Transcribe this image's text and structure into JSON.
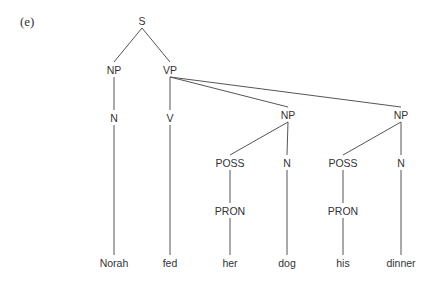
{
  "figure_label": "(e)",
  "nodes": {
    "S": {
      "label": "S",
      "x": 142,
      "y": 25
    },
    "NP1": {
      "label": "NP",
      "x": 114,
      "y": 74
    },
    "VP": {
      "label": "VP",
      "x": 170,
      "y": 74
    },
    "N1": {
      "label": "N",
      "x": 114,
      "y": 122
    },
    "V": {
      "label": "V",
      "x": 170,
      "y": 122
    },
    "NP2": {
      "label": "NP",
      "x": 288,
      "y": 119
    },
    "NP3": {
      "label": "NP",
      "x": 401,
      "y": 119
    },
    "POSS1": {
      "label": "POSS",
      "x": 230,
      "y": 167
    },
    "N2": {
      "label": "N",
      "x": 287,
      "y": 167
    },
    "POSS2": {
      "label": "POSS",
      "x": 343,
      "y": 167
    },
    "N3": {
      "label": "N",
      "x": 401,
      "y": 167
    },
    "PRON1": {
      "label": "PRON",
      "x": 230,
      "y": 215
    },
    "PRON2": {
      "label": "PRON",
      "x": 343,
      "y": 215
    },
    "W1": {
      "label": "Norah",
      "x": 114,
      "y": 267
    },
    "W2": {
      "label": "fed",
      "x": 170,
      "y": 267
    },
    "W3": {
      "label": "her",
      "x": 230,
      "y": 267
    },
    "W4": {
      "label": "dog",
      "x": 287,
      "y": 267
    },
    "W5": {
      "label": "his",
      "x": 343,
      "y": 267
    },
    "W6": {
      "label": "dinner",
      "x": 401,
      "y": 267
    }
  },
  "edges": [
    [
      "S",
      "NP1"
    ],
    [
      "S",
      "VP"
    ],
    [
      "NP1",
      "N1"
    ],
    [
      "VP",
      "V"
    ],
    [
      "VP",
      "NP2"
    ],
    [
      "VP",
      "NP3"
    ],
    [
      "N1",
      "W1"
    ],
    [
      "V",
      "W2"
    ],
    [
      "NP2",
      "POSS1"
    ],
    [
      "NP2",
      "N2"
    ],
    [
      "NP3",
      "POSS2"
    ],
    [
      "NP3",
      "N3"
    ],
    [
      "POSS1",
      "PRON1"
    ],
    [
      "PRON1",
      "W3"
    ],
    [
      "N2",
      "W4"
    ],
    [
      "POSS2",
      "PRON2"
    ],
    [
      "PRON2",
      "W5"
    ],
    [
      "N3",
      "W6"
    ]
  ],
  "sentence": "Norah fed her dog his dinner"
}
